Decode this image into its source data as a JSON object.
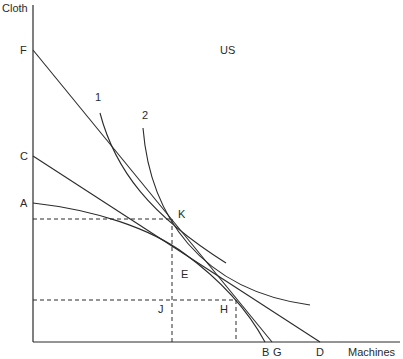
{
  "title": "US",
  "axes": {
    "y_label": "Cloth",
    "x_label": "Machines"
  },
  "points": {
    "F": "F",
    "C": "C",
    "A": "A",
    "K": "K",
    "E": "E",
    "J": "J",
    "H": "H",
    "B": "B",
    "G": "G",
    "D": "D"
  },
  "curves": {
    "indifference_1": "1",
    "indifference_2": "2"
  },
  "colors": {
    "line": "#2b2b2b",
    "background": "#ffffff"
  }
}
